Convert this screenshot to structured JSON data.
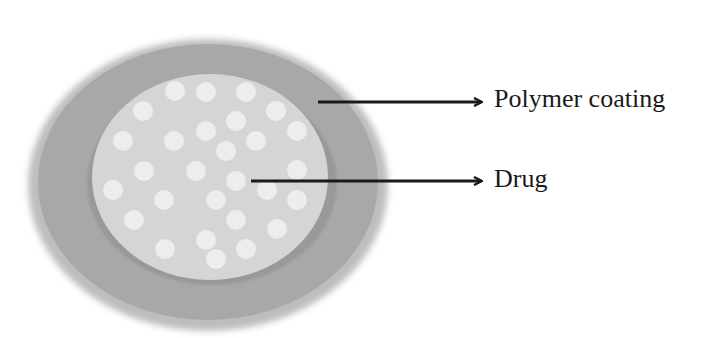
{
  "diagram": {
    "colors": {
      "background": "#ffffff",
      "outer_ring": "#a6a6a6",
      "outer_ring_edge": "#bdbdbd",
      "inner_shadow": "#9a9a9a",
      "core": "#d4d4d4",
      "drug_particle": "#ececec",
      "arrow": "#1a1a1a"
    },
    "labels": {
      "polymer_coating": "Polymer coating",
      "drug": "Drug"
    },
    "components": [
      {
        "name": "polymer-coating",
        "label": "Polymer coating"
      },
      {
        "name": "drug-core",
        "label": "Drug"
      }
    ]
  }
}
